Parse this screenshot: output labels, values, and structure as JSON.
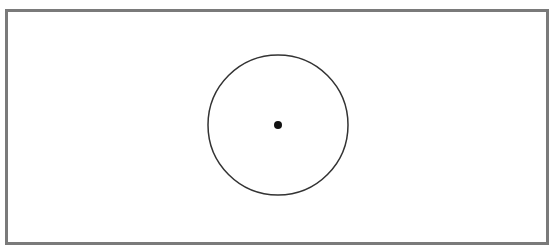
{
  "canvas": {
    "width": 553,
    "height": 250,
    "background": "#ffffff"
  },
  "frame": {
    "x": 6.5,
    "y": 10.5,
    "width": 541,
    "height": 233,
    "stroke": "#7a7a7a",
    "stroke_width": 3
  },
  "circle": {
    "cx": 278,
    "cy": 125,
    "r": 70,
    "stroke": "#333333",
    "stroke_width": 1.5,
    "fill": "none"
  },
  "center_point": {
    "cx": 278,
    "cy": 125,
    "r": 4,
    "fill": "#111111"
  }
}
